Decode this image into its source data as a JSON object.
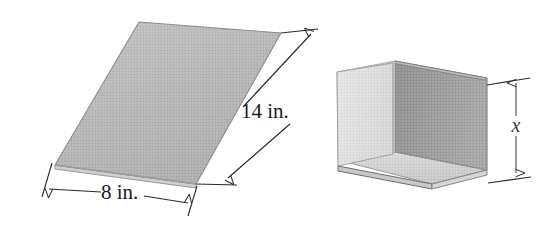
{
  "figure": {
    "background_color": "#ffffff",
    "shapes": {
      "sheet": {
        "name": "flat rectangular sheet in perspective",
        "fill_color": "#b9b9b9",
        "edge_color": "#8c8c8c",
        "thickness_color": "#cfcfcf"
      },
      "channel": {
        "name": "U shaped channel formed from sheet",
        "back_wall_color": "#9a9a9a",
        "front_wall_color": "#e2e2e2",
        "floor_color": "#d2d2d2",
        "inner_wall_color": "#c6c6c6",
        "edge_color": "#7e7e7e"
      }
    },
    "dimensions": [
      {
        "id": "length",
        "label": "14 in.",
        "value": 14,
        "unit": "in.",
        "applies_to": "sheet",
        "orientation": "diagonal-right"
      },
      {
        "id": "width",
        "label": "8 in.",
        "value": 8,
        "unit": "in.",
        "applies_to": "sheet",
        "orientation": "horizontal-bottom"
      },
      {
        "id": "height",
        "label": "x",
        "value": null,
        "unit": "",
        "applies_to": "channel",
        "orientation": "vertical-right"
      }
    ]
  }
}
